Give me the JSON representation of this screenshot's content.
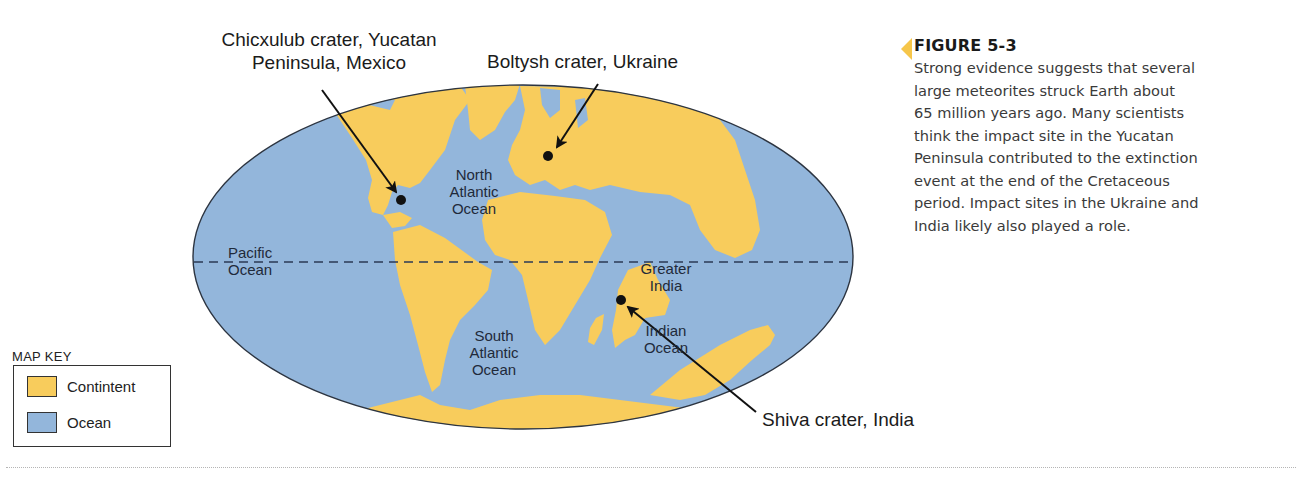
{
  "colors": {
    "continent": "#F8CC5C",
    "ocean": "#93B6DB",
    "outline": "#2c3440",
    "equator": "#2b3a55",
    "caption_marker": "#F6C64A"
  },
  "figure": {
    "title": "FIGURE 5-3",
    "caption": "Strong evidence suggests that several large meteorites struck Earth about 65 million years ago. Many scientists think the impact site in the Yucatan Peninsula contributed to the extinction event at the end of the Cretaceous period. Impact sites in the Ukraine and India likely also played a role.",
    "caption_lines": [
      "Strong evidence suggests that several",
      "large meteorites struck Earth about",
      "65 million years ago. Many scientists",
      "think the impact site in the Yucatan",
      "Peninsula contributed to the extinction",
      "event at the end of the Cretaceous",
      "period. Impact sites in the Ukraine and",
      "India likely also played a role."
    ]
  },
  "map": {
    "projection": "elliptical world map (Late Cretaceous, ~65 Ma)",
    "equator": "dashed line",
    "craters": [
      {
        "name": "Chicxulub crater, Yucatan Peninsula, Mexico",
        "label_lines": [
          "Chicxulub crater, Yucatan",
          "Peninsula, Mexico"
        ],
        "dot": [
          401,
          200
        ]
      },
      {
        "name": "Boltysh crater, Ukraine",
        "label_lines": [
          "Boltysh crater, Ukraine"
        ],
        "dot": [
          548,
          156
        ]
      },
      {
        "name": "Shiva crater, India",
        "label_lines": [
          "Shiva crater, India"
        ],
        "dot": [
          621,
          300
        ]
      }
    ],
    "region_labels": {
      "north_atlantic": [
        "North",
        "Atlantic",
        "Ocean"
      ],
      "pacific": [
        "Pacific",
        "Ocean"
      ],
      "south_atlantic": [
        "South",
        "Atlantic",
        "Ocean"
      ],
      "greater_india": [
        "Greater",
        "India"
      ],
      "indian_ocean": [
        "Indian",
        "Ocean"
      ]
    }
  },
  "map_key": {
    "title": "MAP  KEY",
    "items": [
      {
        "label": "Contintent",
        "color": "#F8CC5C"
      },
      {
        "label": "Ocean",
        "color": "#93B6DB"
      }
    ]
  }
}
